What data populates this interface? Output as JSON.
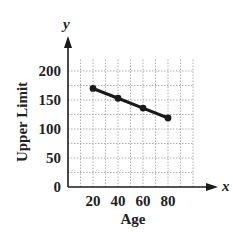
{
  "chart_data": {
    "type": "line",
    "title": "",
    "xlabel": "Age",
    "ylabel": "Upper Limit",
    "x_axis_var": "x",
    "y_axis_var": "y",
    "x": [
      20,
      40,
      60,
      80
    ],
    "series": [
      {
        "name": "Upper Limit",
        "values": [
          170,
          153,
          136,
          119
        ],
        "markers": true
      }
    ],
    "x_ticks": [
      20,
      40,
      60,
      80
    ],
    "y_ticks": [
      0,
      50,
      100,
      150,
      200
    ],
    "xlim": [
      0,
      100
    ],
    "ylim": [
      0,
      220
    ],
    "grid": true,
    "grid_style": "dotted",
    "legend": "none",
    "line_color": "#1a1a1a"
  }
}
